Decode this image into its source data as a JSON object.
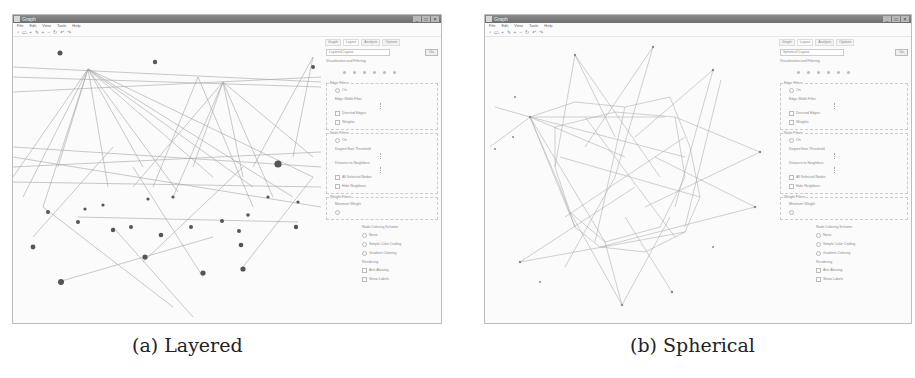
{
  "figure": {
    "captions": {
      "a": "(a) Layered",
      "b": "(b) Spherical"
    }
  },
  "window": {
    "title": "Graph",
    "buttons": [
      "_",
      "□",
      "×"
    ],
    "menu": [
      "File",
      "Edit",
      "View",
      "Tools",
      "Help"
    ],
    "toolbar_icons": [
      "new-icon",
      "open-icon",
      "save-icon",
      "pointer-icon",
      "zoom-in-icon",
      "zoom-out-icon",
      "rotate-icon",
      "fit-icon",
      "undo-icon",
      "redo-icon"
    ]
  },
  "panel": {
    "tabs": [
      "Graph",
      "Layout",
      "Analysis",
      "Options"
    ],
    "active_tab": "Layout",
    "layout_a": "Layered Layout",
    "layout_b": "Spherical Layout",
    "go_label": "Go",
    "section": "Visualization and Filtering",
    "edge_filters": {
      "title": "Edge Filters",
      "on_label": "On",
      "threshold_label": "Edge Width Filter",
      "options": [
        "Directed Edges",
        "Weights"
      ]
    },
    "node_filters": {
      "title": "Node Filters",
      "on_label": "On",
      "degree_label": "Degree/Size Threshold",
      "distance_label": "Distance to Neighbors",
      "options": [
        "All Selected Nodes",
        "Hide Neighbors"
      ]
    },
    "weight_filters": {
      "title": "Weight Filters",
      "label": "Minimum Weight"
    },
    "coloring": {
      "title": "Node Coloring Scheme",
      "options": [
        "None",
        "Simple Color Coding",
        "Gradient Coloring"
      ],
      "extra_title": "Rendering",
      "extra_options": [
        "Anti-Aliasing",
        "Show Labels"
      ]
    }
  }
}
